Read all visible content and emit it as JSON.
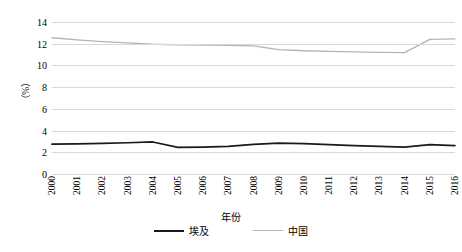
{
  "chart_data": {
    "type": "line",
    "title": "",
    "xlabel": "年份",
    "ylabel": "（%）",
    "categories": [
      "2000",
      "2001",
      "2002",
      "2003",
      "2004",
      "2005",
      "2006",
      "2007",
      "2008",
      "2009",
      "2010",
      "2011",
      "2012",
      "2013",
      "2014",
      "2015",
      "2016"
    ],
    "ylim": [
      0,
      14
    ],
    "ytick_step": 2,
    "yticks": [
      "14",
      "12",
      "10",
      "8",
      "6",
      "4",
      "2",
      "0"
    ],
    "grid": true,
    "legend_position": "bottom",
    "series": [
      {
        "name": "埃及",
        "color": "#1a1a1a",
        "values": [
          2.75,
          2.78,
          2.82,
          2.88,
          2.95,
          2.45,
          2.48,
          2.55,
          2.72,
          2.85,
          2.8,
          2.7,
          2.62,
          2.55,
          2.48,
          2.7,
          2.62
        ]
      },
      {
        "name": "中国",
        "color": "#b4b4b4",
        "values": [
          12.55,
          12.35,
          12.2,
          12.08,
          11.95,
          11.9,
          11.88,
          11.85,
          11.8,
          11.45,
          11.35,
          11.3,
          11.25,
          11.2,
          11.18,
          12.4,
          12.45
        ]
      }
    ]
  },
  "axis": {
    "y_title": "（%）",
    "x_title": "年份"
  },
  "legend": {
    "items": [
      {
        "label": "埃及",
        "key": "egypt"
      },
      {
        "label": "中国",
        "key": "china"
      }
    ]
  },
  "caption": {
    "text": ""
  }
}
